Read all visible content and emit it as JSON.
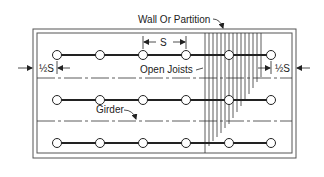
{
  "diagram": {
    "labels": {
      "wall": "Wall Or Partition",
      "joists": "Open Joists",
      "girder": "Girder",
      "spacing": "S",
      "half_spacing_left": "½S",
      "half_spacing_right": "½S"
    },
    "colors": {
      "line": "#222222",
      "frame": "#555555",
      "background": "#ffffff"
    },
    "joist_rows_y": [
      55,
      100,
      143
    ],
    "joist_node_x": [
      57,
      100,
      143,
      186,
      229,
      271
    ],
    "centerlines_y": [
      78,
      121
    ]
  }
}
